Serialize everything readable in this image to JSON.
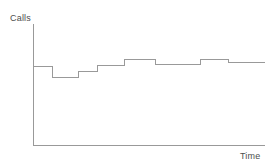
{
  "chart_data": {
    "type": "line",
    "subtype": "step",
    "title": "",
    "xlabel": "Time",
    "ylabel": "Calls",
    "grid": false,
    "legend": null,
    "axis_style": {
      "x_axis": true,
      "y_axis": true,
      "ticks": false,
      "tick_labels": false,
      "axis_color": "#999999",
      "line_color": "#999999",
      "line_width": 1
    },
    "xlim": [
      0,
      10
    ],
    "ylim": [
      0,
      10
    ],
    "x": [
      0.0,
      0.82,
      1.94,
      2.76,
      3.92,
      5.26,
      7.21,
      8.42,
      10.0
    ],
    "step_levels": [
      6.5,
      5.6,
      6.05,
      6.6,
      7.1,
      6.65,
      7.1,
      6.8
    ],
    "steps": [
      {
        "x_start": 0.0,
        "x_end": 0.82,
        "level": 6.5
      },
      {
        "x_start": 0.82,
        "x_end": 1.94,
        "level": 5.6
      },
      {
        "x_start": 1.94,
        "x_end": 2.76,
        "level": 6.05
      },
      {
        "x_start": 2.76,
        "x_end": 3.92,
        "level": 6.6
      },
      {
        "x_start": 3.92,
        "x_end": 5.26,
        "level": 7.1
      },
      {
        "x_start": 5.26,
        "x_end": 7.21,
        "level": 6.65
      },
      {
        "x_start": 7.21,
        "x_end": 8.42,
        "level": 7.1
      },
      {
        "x_start": 8.42,
        "x_end": 10.0,
        "level": 6.8
      }
    ]
  },
  "labels": {
    "y_axis_label": "Calls",
    "x_axis_label": "Time"
  },
  "colors": {
    "background": "#ffffff",
    "axis": "#999999",
    "series": "#999999",
    "text": "#4d4d4d"
  }
}
